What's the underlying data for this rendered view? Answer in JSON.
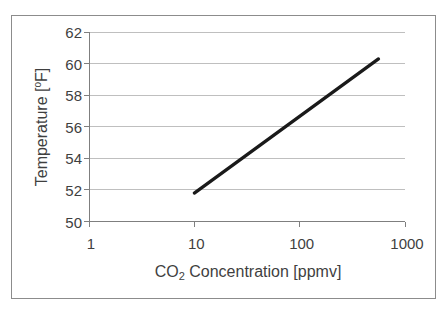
{
  "page": {
    "background": "#ffffff"
  },
  "chart": {
    "frame_border_color": "#8c8c8c",
    "plot_background": "#ffffff"
  },
  "chart_data": {
    "type": "line",
    "title": "",
    "xlabel": "CO2 Concentration [ppmv]",
    "ylabel": "Temperature [°F]",
    "x_scale": "log10",
    "xlim": [
      1,
      1000
    ],
    "ylim": [
      50,
      62
    ],
    "xticks": [
      "1",
      "10",
      "100",
      "1000"
    ],
    "xtick_values": [
      1,
      10,
      100,
      1000
    ],
    "yticks": [
      "50",
      "52",
      "54",
      "56",
      "58",
      "60",
      "62"
    ],
    "ytick_values": [
      50,
      52,
      54,
      56,
      58,
      60,
      62
    ],
    "grid": "horizontal-major",
    "legend": "none",
    "colors": {
      "gridline": "#bfbfbf",
      "axis": "#7f7f7f",
      "tick_text": "#3f3f3f",
      "series": "#1a1a1a"
    },
    "series": [
      {
        "name": "Temperature",
        "points": [
          [
            10,
            51.8
          ],
          [
            560,
            60.3
          ]
        ],
        "color": "#1a1a1a",
        "stroke_width": 3.25
      }
    ],
    "x_axis_title": {
      "pre": "CO",
      "sub": "2",
      "post": " Concentration [ppmv]"
    },
    "y_axis_title": {
      "pre": "Temperature [",
      "sup": "o",
      "post": "F]"
    }
  }
}
